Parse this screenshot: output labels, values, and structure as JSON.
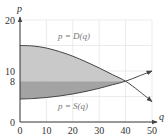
{
  "chart_data": {
    "type": "area",
    "title": "",
    "xlabel": "q",
    "ylabel": "p",
    "xlim": [
      0,
      50
    ],
    "ylim": [
      0,
      20
    ],
    "x_ticks": [
      0,
      10,
      20,
      30,
      40,
      50
    ],
    "y_ticks": [
      0,
      8,
      10,
      20
    ],
    "grid": true,
    "series": [
      {
        "name": "p = D(q)",
        "kind": "demand",
        "x": [
          0,
          5,
          10,
          15,
          20,
          25,
          30,
          35,
          40,
          45,
          50
        ],
        "values": [
          15,
          14.9,
          14.5,
          13.8,
          12.9,
          11.8,
          10.6,
          9.3,
          8,
          6.1,
          4
        ]
      },
      {
        "name": "p = S(q)",
        "kind": "supply",
        "x": [
          0,
          5,
          10,
          15,
          20,
          25,
          30,
          35,
          40,
          45,
          50
        ],
        "values": [
          4.5,
          4.6,
          4.8,
          5.1,
          5.5,
          6,
          6.6,
          7.3,
          8,
          9,
          10
        ]
      }
    ],
    "equilibrium": {
      "q": 40,
      "p": 8
    },
    "shaded_regions": [
      {
        "name": "consumer surplus",
        "between": [
          "p = D(q)",
          "p = 8"
        ],
        "q_range": [
          0,
          40
        ],
        "color": "#c9c9c9"
      },
      {
        "name": "producer surplus",
        "between": [
          "p = 8",
          "p = S(q)"
        ],
        "q_range": [
          0,
          40
        ],
        "color": "#a3a3a3"
      }
    ],
    "annotations": [
      {
        "text": "p = D(q)",
        "q": 23,
        "p": 16.3
      },
      {
        "text": "p = S(q)",
        "q": 23,
        "p": 3.2
      }
    ]
  },
  "labels": {
    "x_axis": "q",
    "y_axis": "p",
    "x_ticks": [
      "0",
      "10",
      "20",
      "30",
      "40",
      "50"
    ],
    "y_ticks": [
      "0",
      "8",
      "10",
      "20"
    ],
    "demand_label": "p = D(q)",
    "supply_label": "p = S(q)"
  },
  "colors": {
    "consumer_surplus": "#c9c9c9",
    "producer_surplus": "#a3a3a3",
    "curve": "#444444",
    "axis": "#333333",
    "grid": "#e6e6e6"
  }
}
